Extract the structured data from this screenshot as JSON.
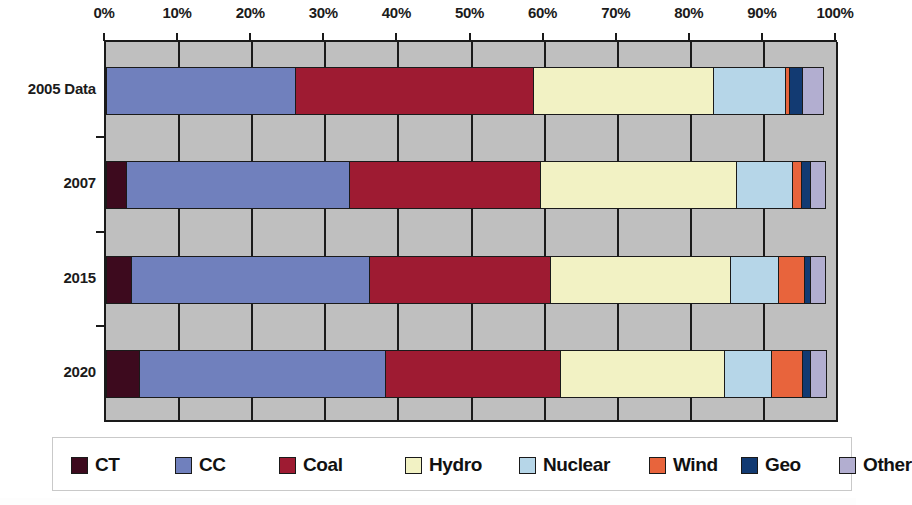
{
  "chart_data": {
    "type": "bar",
    "orientation": "horizontal",
    "stacked": true,
    "normalized": true,
    "title": "",
    "subtitle": "",
    "xlabel": "",
    "ylabel": "",
    "xlim": [
      0,
      100
    ],
    "grid": true,
    "grid_axis": "x",
    "plot_background": "#bfbfbf",
    "legend_position": "bottom",
    "xticks": [
      0,
      10,
      20,
      30,
      40,
      50,
      60,
      70,
      80,
      90,
      100
    ],
    "xtick_labels": [
      "0%",
      "10%",
      "20%",
      "30%",
      "40%",
      "50%",
      "60%",
      "70%",
      "80%",
      "90%",
      "100%"
    ],
    "categories": [
      "2005 Data",
      "2007",
      "2015",
      "2020"
    ],
    "series": [
      {
        "name": "CT",
        "color": "#3d0a1e",
        "values": [
          0.0,
          3.0,
          3.6,
          4.7
        ]
      },
      {
        "name": "CC",
        "color": "#7080bd",
        "values": [
          26.1,
          30.7,
          32.8,
          33.9
        ]
      },
      {
        "name": "Coal",
        "color": "#9e1b32",
        "values": [
          32.7,
          26.3,
          25.0,
          24.1
        ]
      },
      {
        "name": "Hydro",
        "color": "#f2f2c4",
        "values": [
          24.9,
          27.0,
          24.8,
          22.7
        ]
      },
      {
        "name": "Nuclear",
        "color": "#b6d6e8",
        "values": [
          10.0,
          7.9,
          6.8,
          6.6
        ]
      },
      {
        "name": "Wind",
        "color": "#e8643c",
        "values": [
          0.7,
          1.4,
          3.7,
          4.4
        ]
      },
      {
        "name": "Geo",
        "color": "#123a72",
        "values": [
          2.0,
          1.4,
          1.1,
          1.4
        ]
      },
      {
        "name": "Other",
        "color": "#b2aed0",
        "values": [
          3.1,
          2.3,
          2.1,
          2.3
        ]
      }
    ]
  },
  "legend": {
    "items": [
      {
        "label": "CT",
        "color": "#3d0a1e"
      },
      {
        "label": "CC",
        "color": "#7080bd"
      },
      {
        "label": "Coal",
        "color": "#9e1b32"
      },
      {
        "label": "Hydro",
        "color": "#f2f2c4"
      },
      {
        "label": "Nuclear",
        "color": "#b6d6e8"
      },
      {
        "label": "Wind",
        "color": "#e8643c"
      },
      {
        "label": "Geo",
        "color": "#123a72"
      },
      {
        "label": "Other",
        "color": "#b2aed0"
      }
    ]
  }
}
